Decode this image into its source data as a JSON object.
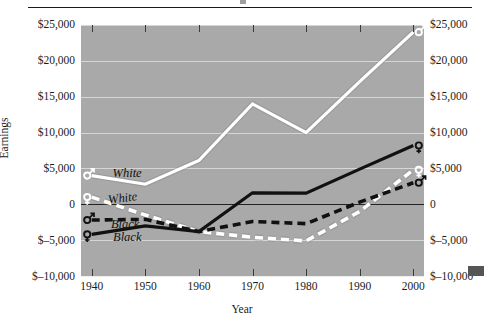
{
  "chart_data": {
    "type": "line",
    "title": "",
    "xlabel": "Year",
    "ylabel": "Earnings",
    "x": [
      1940,
      1950,
      1960,
      1970,
      1980,
      1990,
      2000
    ],
    "xlim": [
      1938,
      2002
    ],
    "ylim": [
      -10000,
      25000
    ],
    "grid": true,
    "legend_position": "inline",
    "x_tick_labels": [
      "1940",
      "1950",
      "1960",
      "1970",
      "1980",
      "1990",
      "2000"
    ],
    "y_tick_values": [
      25000,
      20000,
      15000,
      10000,
      5000,
      0,
      -5000,
      -10000
    ],
    "y_tick_labels_left": [
      "$25,000",
      "$20,000",
      "$15,000",
      "$10,000",
      "$5,000",
      "0",
      "$–5,000",
      "$–10,000"
    ],
    "y_tick_labels_right": [
      "$25,000",
      "$20,000",
      "$15,000",
      "$10,000",
      "$5,000",
      "0",
      "$–5,000",
      "$–10,000"
    ],
    "series": [
      {
        "name": "White men",
        "inline_label": "White",
        "color": "#ffffff",
        "style": "solid",
        "start_marker": "male-symbol",
        "end_marker": "male-symbol",
        "values": [
          4000,
          2800,
          6100,
          14000,
          10000,
          17100,
          24000
        ]
      },
      {
        "name": "White women",
        "inline_label": "White",
        "color": "#ffffff",
        "style": "dashed",
        "start_marker": "female-symbol",
        "end_marker": "female-symbol",
        "values": [
          1000,
          -1500,
          -3800,
          -4600,
          -5100,
          -1000,
          4800
        ]
      },
      {
        "name": "Black men",
        "inline_label": "Black",
        "color": "#111111",
        "style": "dashed",
        "start_marker": "male-symbol",
        "end_marker": "male-symbol",
        "values": [
          -2200,
          -2100,
          -3800,
          -2400,
          -2700,
          300,
          3000
        ]
      },
      {
        "name": "Black women",
        "inline_label": "Black",
        "color": "#111111",
        "style": "solid",
        "start_marker": "female-symbol",
        "end_marker": "female-symbol",
        "values": [
          -4200,
          -3000,
          -3800,
          1600,
          1550,
          4900,
          8200
        ]
      }
    ],
    "annotations": [
      {
        "text": "White",
        "series": "White men",
        "x": 1943.5,
        "y": 4300
      },
      {
        "text": "White",
        "series": "White women",
        "x": 1942.6,
        "y": 900
      },
      {
        "text": "Black",
        "series": "Black men",
        "x": 1943.2,
        "y": -2700
      },
      {
        "text": "Black",
        "series": "Black women",
        "x": 1943.6,
        "y": -4600
      }
    ]
  },
  "axes": {
    "y_title": "Earnings",
    "x_title": "Year"
  },
  "icons": {
    "male": "♂",
    "female": "♀"
  },
  "colors": {
    "panel_background": "#a9a9a9",
    "gridline": "#e8e8e8",
    "zero_line": "#232323",
    "light_series": "#ffffff",
    "dark_series": "#111111",
    "text": "#1b1b1b"
  }
}
